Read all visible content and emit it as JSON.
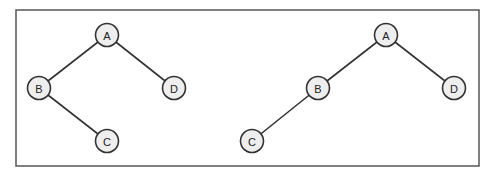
{
  "diagram": {
    "frame": {
      "x": 16,
      "y": 10,
      "w": 463,
      "h": 156,
      "stroke": "#555555"
    },
    "trees": [
      {
        "name": "tree-left",
        "nodes": [
          {
            "id": "A",
            "label": "A",
            "x": 107,
            "y": 35
          },
          {
            "id": "B",
            "label": "B",
            "x": 39,
            "y": 88
          },
          {
            "id": "D",
            "label": "D",
            "x": 174,
            "y": 88
          },
          {
            "id": "C",
            "label": "C",
            "x": 107,
            "y": 141
          }
        ],
        "edges": [
          [
            "A",
            "B"
          ],
          [
            "A",
            "D"
          ],
          [
            "B",
            "C"
          ]
        ]
      },
      {
        "name": "tree-right",
        "nodes": [
          {
            "id": "A",
            "label": "A",
            "x": 386,
            "y": 35
          },
          {
            "id": "B",
            "label": "B",
            "x": 318,
            "y": 88
          },
          {
            "id": "D",
            "label": "D",
            "x": 454,
            "y": 88
          },
          {
            "id": "C",
            "label": "C",
            "x": 252,
            "y": 141
          }
        ],
        "edges": [
          [
            "A",
            "B"
          ],
          [
            "A",
            "D"
          ],
          [
            "B",
            "C"
          ]
        ]
      }
    ],
    "node_radius": 11.5
  }
}
